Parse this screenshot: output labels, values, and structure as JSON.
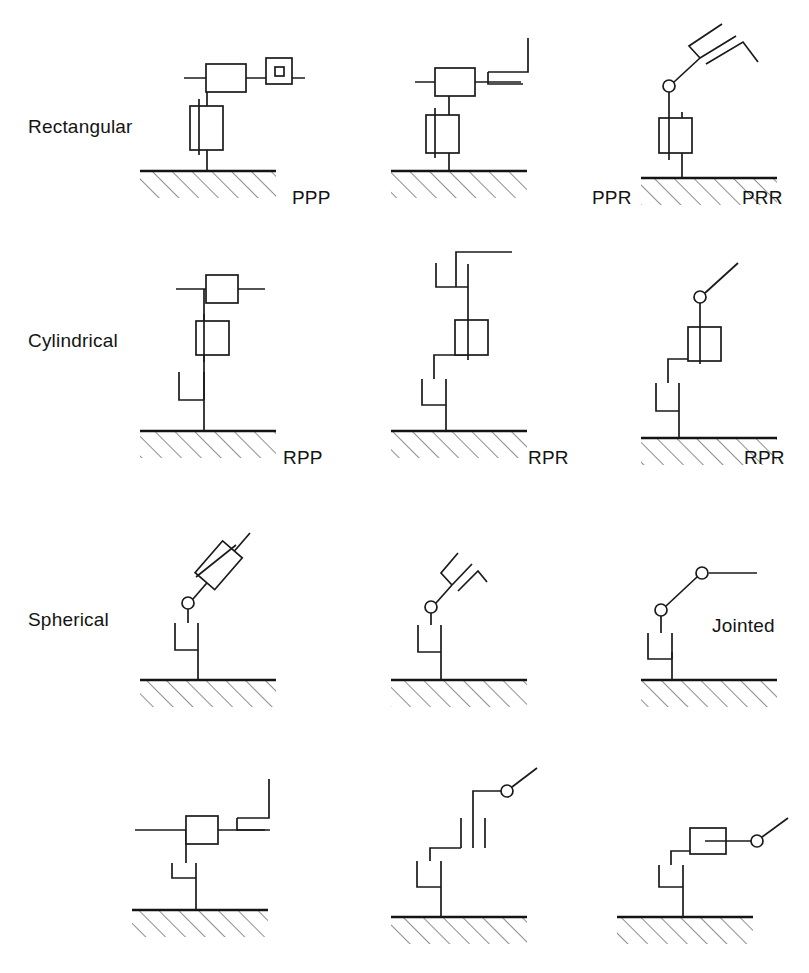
{
  "figure": {
    "background_color": "#ffffff",
    "line_color": "#1a1a1a",
    "hatch_color": "#3a3a3a",
    "width": 809,
    "height": 973
  },
  "row_labels": [
    {
      "id": "rectangular",
      "text": "Rectangular",
      "x": 28,
      "y": 133
    },
    {
      "id": "cylindrical",
      "text": "Cylindrical",
      "x": 28,
      "y": 347
    },
    {
      "id": "spherical",
      "text": "Spherical",
      "x": 28,
      "y": 626
    },
    {
      "id": "row4",
      "text": "",
      "x": 28,
      "y": 870
    }
  ],
  "extra_labels": [
    {
      "id": "jointed",
      "text": "Jointed",
      "x": 712,
      "y": 632
    }
  ],
  "cells": [
    {
      "id": "r1c1",
      "row": "Rectangular",
      "config": "PPP",
      "label_x": 292,
      "label_y": 204,
      "joint_sequence": [
        "P",
        "P",
        "P"
      ],
      "base": "prismatic",
      "end_effector": "square-tool"
    },
    {
      "id": "r1c2",
      "row": "Rectangular",
      "config": "PPR",
      "label_x": 592,
      "label_y": 204,
      "joint_sequence": [
        "P",
        "P",
        "R"
      ],
      "base": "prismatic",
      "end_effector": "gripper-horizontal"
    },
    {
      "id": "r1c3",
      "row": "Rectangular",
      "config": "PRR",
      "label_x": 742,
      "label_y": 204,
      "joint_sequence": [
        "P",
        "R",
        "R"
      ],
      "base": "prismatic",
      "end_effector": "gripper-angled"
    },
    {
      "id": "r2c1",
      "row": "Cylindrical",
      "config": "RPP",
      "label_x": 283,
      "label_y": 464,
      "joint_sequence": [
        "R",
        "P",
        "P"
      ],
      "base": "revolute",
      "end_effector": "sliding-bar"
    },
    {
      "id": "r2c2",
      "row": "Cylindrical",
      "config": "RPR",
      "label_x": 528,
      "label_y": 464,
      "joint_sequence": [
        "R",
        "P",
        "R"
      ],
      "base": "revolute",
      "end_effector": "gripper-horizontal"
    },
    {
      "id": "r2c3",
      "row": "Cylindrical",
      "config": "RPR",
      "label_x": 744,
      "label_y": 464,
      "joint_sequence": [
        "R",
        "P",
        "R"
      ],
      "base": "revolute",
      "end_effector": "pivot-arm"
    },
    {
      "id": "r3c1",
      "row": "Spherical",
      "config": "",
      "label_x": 0,
      "label_y": 0,
      "joint_sequence": [
        "R",
        "R",
        "P"
      ],
      "base": "revolute",
      "end_effector": "prismatic-angled"
    },
    {
      "id": "r3c2",
      "row": "Spherical",
      "config": "",
      "label_x": 0,
      "label_y": 0,
      "joint_sequence": [
        "R",
        "R",
        "R"
      ],
      "base": "revolute",
      "end_effector": "gripper-angled"
    },
    {
      "id": "r3c3",
      "row": "Spherical",
      "config": "",
      "label_x": 0,
      "label_y": 0,
      "joint_sequence": [
        "R",
        "R",
        "R"
      ],
      "base": "revolute",
      "end_effector": "jointed-arm"
    },
    {
      "id": "r4c1",
      "row": "",
      "config": "",
      "label_x": 0,
      "label_y": 0,
      "joint_sequence": [
        "R",
        "P",
        "R"
      ],
      "base": "revolute",
      "end_effector": "gripper-horizontal"
    },
    {
      "id": "r4c2",
      "row": "",
      "config": "",
      "label_x": 0,
      "label_y": 0,
      "joint_sequence": [
        "R",
        "P",
        "R"
      ],
      "base": "revolute",
      "end_effector": "pivot-arm"
    },
    {
      "id": "r4c3",
      "row": "",
      "config": "",
      "label_x": 0,
      "label_y": 0,
      "joint_sequence": [
        "R",
        "P",
        "R"
      ],
      "base": "revolute",
      "end_effector": "box-pivot-arm"
    }
  ],
  "config_labels": {
    "ppp": "PPP",
    "ppr": "PPR",
    "prr": "PRR",
    "rpp": "RPP",
    "rpr_a": "RPR",
    "rpr_b": "RPR"
  },
  "caption": {
    "partial_text": ""
  }
}
